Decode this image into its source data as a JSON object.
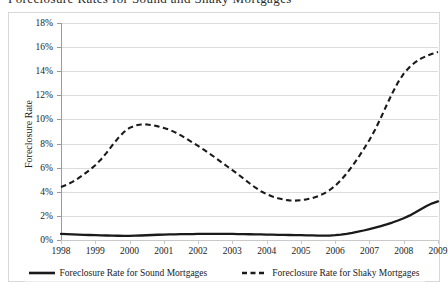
{
  "figure": {
    "cropped_title": "Foreclosure Rates for Sound and Shaky Mortgages"
  },
  "axes": {
    "ylabel": "Foreclosure Rate",
    "xlabel": "",
    "ytick_labels": [
      "18%",
      "16%",
      "14%",
      "12%",
      "10%",
      "8%",
      "6%",
      "4%",
      "2%",
      "0%"
    ],
    "xtick_labels": [
      "1998",
      "1999",
      "2000",
      "2001",
      "2002",
      "2003",
      "2004",
      "2005",
      "2006",
      "2007",
      "2008",
      "2009"
    ]
  },
  "legend": {
    "position": "bottom",
    "items": [
      {
        "label": "Foreclosure Rate for Sound Mortgages",
        "style": "solid",
        "icon": "solid-line-swatch"
      },
      {
        "label": "Foreclosure Rate for Shaky Mortgages",
        "style": "dashed",
        "icon": "dashed-line-swatch"
      }
    ]
  },
  "colors": {
    "line": "#1a1a1a",
    "grid": "#dcdcdc",
    "axis": "#9a9a9a",
    "frame": "#d8d8d8",
    "background": "#ffffff"
  },
  "chart_data": {
    "type": "line",
    "title": "Foreclosure Rates for Sound and Shaky Mortgages",
    "xlabel": "",
    "ylabel": "Foreclosure Rate",
    "x": [
      1998,
      1999,
      2000,
      2001,
      2002,
      2003,
      2004,
      2005,
      2006,
      2007,
      2008,
      2009
    ],
    "categories": [
      "1998",
      "1999",
      "2000",
      "2001",
      "2002",
      "2003",
      "2004",
      "2005",
      "2006",
      "2007",
      "2008",
      "2009"
    ],
    "ylim": [
      0,
      18
    ],
    "ytick_values": [
      0,
      2,
      4,
      6,
      8,
      10,
      12,
      14,
      16,
      18
    ],
    "yunit": "percent",
    "grid": true,
    "legend_position": "bottom",
    "series": [
      {
        "name": "Foreclosure Rate for Sound Mortgages",
        "style": "solid",
        "values": [
          0.5,
          0.4,
          0.35,
          0.45,
          0.5,
          0.5,
          0.45,
          0.4,
          0.4,
          0.9,
          1.8,
          3.2
        ]
      },
      {
        "name": "Foreclosure Rate for Shaky Mortgages",
        "style": "dashed",
        "values": [
          4.4,
          6.2,
          9.3,
          9.3,
          7.8,
          5.8,
          3.8,
          3.3,
          4.5,
          8.3,
          13.8,
          15.6
        ]
      }
    ]
  }
}
